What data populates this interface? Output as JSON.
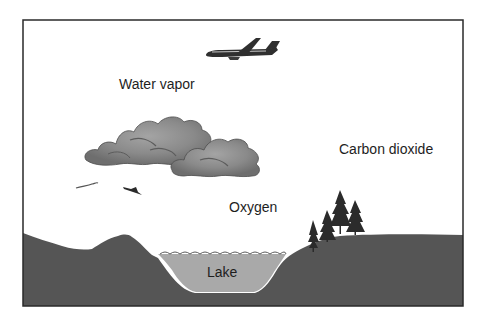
{
  "diagram": {
    "labels": {
      "water_vapor": "Water vapor",
      "carbon_dioxide": "Carbon dioxide",
      "oxygen": "Oxygen",
      "lake": "Lake"
    },
    "elements": [
      "airplane",
      "clouds",
      "birds",
      "trees",
      "hill",
      "lake",
      "ground"
    ],
    "colors": {
      "frame": "#2a2a2a",
      "sky": "#ffffff",
      "ground": "#555555",
      "lake": "#a9a9a9",
      "cloud_light": "#9a9a9a",
      "cloud_dark": "#6f6f6f",
      "trees": "#2b2b2b",
      "text": "#1e1e1e"
    }
  }
}
